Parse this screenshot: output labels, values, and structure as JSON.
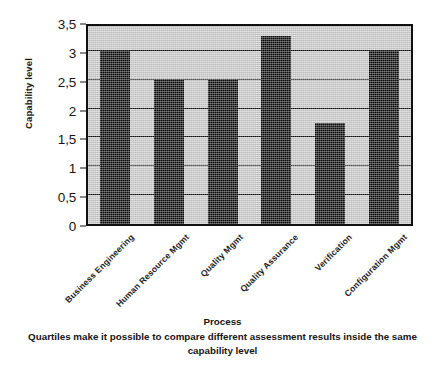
{
  "chart_data": {
    "type": "bar",
    "title": "",
    "xlabel": "Process",
    "ylabel": "Capability level",
    "categories": [
      "Business Engineering",
      "Human Resource Mgmt",
      "Quality Mgmt",
      "Quality Assurance",
      "Verification",
      "Configuration Mgmt"
    ],
    "values": [
      3,
      2.5,
      2.5,
      3.25,
      1.75,
      3
    ],
    "ylim": [
      0,
      3.5
    ],
    "ytick_values": [
      0,
      0.5,
      1,
      1.5,
      2,
      2.5,
      3,
      3.5
    ],
    "ytick_labels": [
      "0",
      "0,5",
      "1",
      "1,5",
      "2",
      "2,5",
      "3",
      "3,5"
    ],
    "grid": true,
    "legend": "none",
    "bar_color": "#0b0b0b",
    "plot_background": "#c9c9c9",
    "axis_color": "#101010"
  },
  "caption": {
    "line1": "Quartiles make it possible to compare different assessment results inside the same",
    "line2": "capability level"
  }
}
